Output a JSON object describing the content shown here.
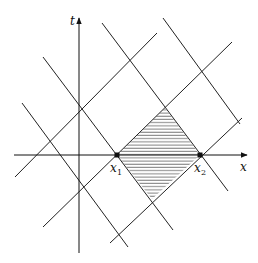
{
  "diagram": {
    "axes": {
      "x_label": "x",
      "t_label": "t",
      "origin": [
        79,
        155
      ],
      "x_axis": {
        "from": [
          14,
          155
        ],
        "to": [
          247,
          155
        ]
      },
      "t_axis": {
        "from": [
          79,
          253
        ],
        "to": [
          79,
          18
        ]
      }
    },
    "points": [
      {
        "id": "x1",
        "label": "x",
        "subscript": "1",
        "pos": [
          117,
          155
        ],
        "label_pos": [
          110,
          172
        ]
      },
      {
        "id": "x2",
        "label": "x",
        "subscript": "2",
        "pos": [
          200,
          155
        ],
        "label_pos": [
          194,
          172
        ]
      }
    ],
    "lines_positive_slope": [
      {
        "from": [
          15,
          177
        ],
        "to": [
          157,
          33
        ]
      },
      {
        "from": [
          43,
          227
        ],
        "to": [
          232,
          42
        ]
      },
      {
        "from": [
          110,
          243
        ],
        "to": [
          242,
          118
        ]
      }
    ],
    "lines_negative_slope": [
      {
        "from": [
          22,
          103
        ],
        "to": [
          128,
          247
        ]
      },
      {
        "from": [
          43,
          57
        ],
        "to": [
          173,
          230
        ]
      },
      {
        "from": [
          102,
          23
        ],
        "to": [
          228,
          191
        ]
      },
      {
        "from": [
          163,
          18
        ],
        "to": [
          240,
          124
        ]
      }
    ],
    "shaded_region": {
      "pattern": "horizontal-hatch",
      "vertices": [
        [
          117,
          155
        ],
        [
          165,
          108
        ],
        [
          200,
          155
        ],
        [
          152,
          199
        ]
      ]
    },
    "colors": {
      "line": "#222222",
      "background": "#ffffff"
    }
  }
}
